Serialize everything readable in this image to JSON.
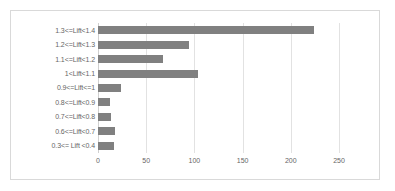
{
  "chart_data": {
    "type": "bar",
    "orientation": "horizontal",
    "title": "",
    "xlabel": "",
    "ylabel": "",
    "categories": [
      "1.3<=Lift<1.4",
      "1.2<=Lift<1.3",
      "1.1<=Lift<1.2",
      "1<Lift<1.1",
      "0.9<=Lift<=1",
      "0.8<=Lift<0.9",
      "0.7<=Lift<0.8",
      "0.6<=Lift<0.7",
      "0.3<= Lift <0.4"
    ],
    "values": [
      224,
      94,
      67,
      104,
      24,
      12,
      13,
      18,
      17
    ],
    "xticks": [
      0,
      50,
      100,
      150,
      200,
      250
    ],
    "xtick_labels": [
      "0",
      "50",
      "100",
      "150",
      "200",
      "250"
    ],
    "xlim": [
      0,
      250
    ],
    "grid": "vertical",
    "legend": "none",
    "bar_color": "#808080",
    "gridline_color": "#e2e2e2",
    "axis_text_color": "#666666",
    "border_color": "#d9d9d9",
    "plot_background": "#ffffff"
  }
}
